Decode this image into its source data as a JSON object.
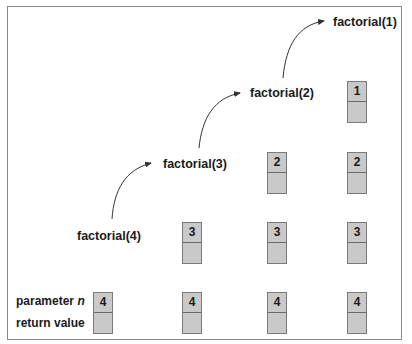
{
  "calls": [
    {
      "label": "factorial(4)"
    },
    {
      "label": "factorial(3)"
    },
    {
      "label": "factorial(2)"
    },
    {
      "label": "factorial(1)"
    }
  ],
  "legend": {
    "parameter_label": "parameter ",
    "parameter_var": "n",
    "return_label": "return value"
  },
  "stacks": [
    {
      "frames": [
        "4"
      ]
    },
    {
      "frames": [
        "3",
        "4"
      ]
    },
    {
      "frames": [
        "2",
        "3",
        "4"
      ]
    },
    {
      "frames": [
        "1",
        "2",
        "3",
        "4"
      ]
    }
  ],
  "colors": {
    "box_fill": "#c9c9c9",
    "box_border": "#7a7a7a",
    "frame_border": "#8a8a8a",
    "text": "#1a1a1a"
  }
}
